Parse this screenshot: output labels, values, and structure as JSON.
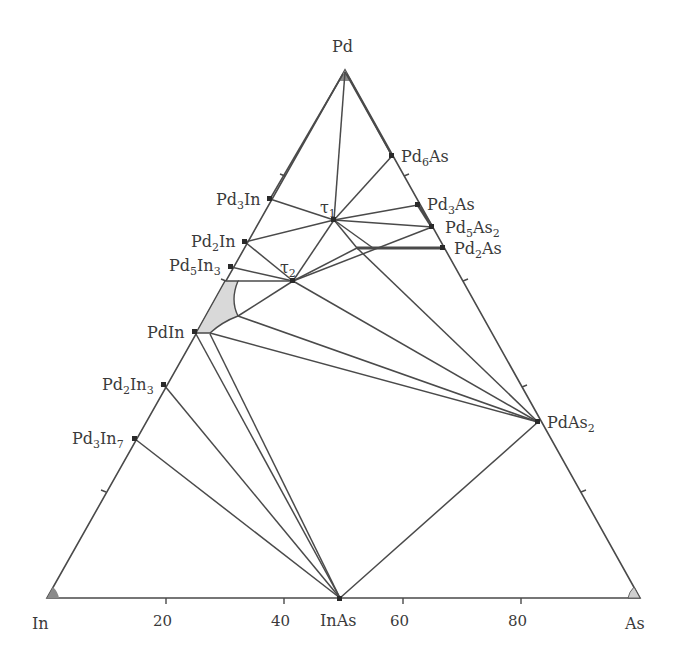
{
  "diagram": {
    "type": "ternary_phase_diagram",
    "system": "In-Pd-As",
    "vertices": {
      "top": "Pd",
      "bottom_left": "In",
      "bottom_right": "As"
    },
    "bottom_axis_ticks": [
      "20",
      "40",
      "60",
      "80"
    ],
    "phases": {
      "pd6as": {
        "base": "Pd",
        "sub1": "6",
        "mid": "As",
        "sub2": ""
      },
      "pd3as": {
        "base": "Pd",
        "sub1": "3",
        "mid": "As",
        "sub2": ""
      },
      "pd5as2": {
        "base": "Pd",
        "sub1": "5",
        "mid": "As",
        "sub2": "2"
      },
      "pd2as": {
        "base": "Pd",
        "sub1": "2",
        "mid": "As",
        "sub2": ""
      },
      "pdas2": {
        "base": "PdAs",
        "sub1": "2"
      },
      "pd3in": {
        "base": "Pd",
        "sub1": "3",
        "mid": "In",
        "sub2": ""
      },
      "pd2in": {
        "base": "Pd",
        "sub1": "2",
        "mid": "In",
        "sub2": ""
      },
      "pd5in3": {
        "base": "Pd",
        "sub1": "5",
        "mid": "In",
        "sub2": "3"
      },
      "pdin": {
        "base": "PdIn"
      },
      "pd2in3": {
        "base": "Pd",
        "sub1": "2",
        "mid": "In",
        "sub2": "3"
      },
      "pd3in7": {
        "base": "Pd",
        "sub1": "3",
        "mid": "In",
        "sub2": "7"
      },
      "inas": {
        "base": "InAs"
      },
      "tau1": {
        "base": "τ",
        "sub1": "1"
      },
      "tau2": {
        "base": "τ",
        "sub1": "2"
      }
    },
    "colors": {
      "line": "#4a4a4a",
      "shaded_region": "#d9d9d9",
      "text": "#3a3a3a"
    }
  }
}
